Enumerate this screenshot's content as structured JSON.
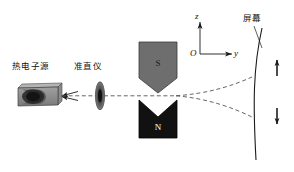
{
  "figure": {
    "width": 294,
    "height": 172,
    "background": "#ffffff"
  },
  "labels": {
    "electron_source": "热电子源",
    "collimator": "准直仪",
    "screen": "屏幕"
  },
  "axes": {
    "origin": "O",
    "vertical": "z",
    "horizontal": "y"
  },
  "magnet": {
    "top_pole": "S",
    "bottom_pole": "N",
    "top_pole_color": "#6e6e6e",
    "bottom_pole_color": "#111111",
    "top_pole_text_color": "#1a1a1a",
    "bottom_pole_text_color": "#ffffff"
  },
  "beam": {
    "axis_style": "dashed",
    "color": "#555555",
    "split_count": 2
  },
  "spin_arrows": {
    "up": "spin-up-arrow",
    "down": "spin-down-arrow"
  },
  "colors": {
    "stroke": "#1a1a1a",
    "dashed": "#555555",
    "source_body": "#8c8c8c",
    "source_cavity": "#2b2b2b",
    "collimator": "#777777"
  }
}
